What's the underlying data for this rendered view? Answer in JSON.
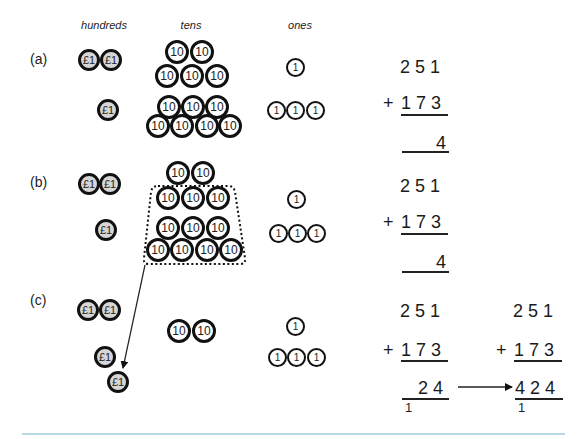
{
  "headers": {
    "hundreds": "hundreds",
    "tens": "tens",
    "ones": "ones"
  },
  "coin_labels": {
    "pound": "£1",
    "ten": "10",
    "one": "1"
  },
  "sections": [
    {
      "label": "(a)",
      "hundreds_coins": 3,
      "tens_coins": 12,
      "ones_coins": 4,
      "sum": {
        "top": "2 5 1",
        "plus": "+",
        "addend": "1 7 3",
        "result": "4"
      }
    },
    {
      "label": "(b)",
      "hundreds_coins": 3,
      "tens_coins": 12,
      "tens_grouped": 10,
      "ones_coins": 4,
      "sum": {
        "top": "2 5 1",
        "plus": "+",
        "addend": "1 7 3",
        "result": "4"
      }
    },
    {
      "label": "(c)",
      "hundreds_coins": 4,
      "tens_coins": 2,
      "ones_coins": 4,
      "sum": {
        "top": "2 5 1",
        "plus": "+",
        "addend": "1 7 3",
        "result": "2 4",
        "carry": "1"
      },
      "sum_final": {
        "top": "2 5 1",
        "plus": "+",
        "addend": "1 7 3",
        "result": "4 2 4",
        "carry": "1"
      }
    }
  ],
  "colors": {
    "pound_fill": "#d6d6d6",
    "coin_border": "#111111",
    "rule": "#b9d8e8"
  }
}
